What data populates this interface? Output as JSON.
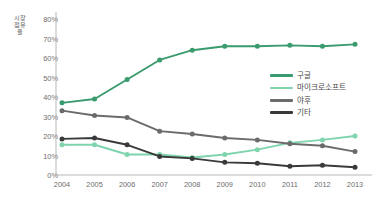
{
  "chart_data": {
    "type": "line",
    "title": "",
    "xlabel": "",
    "ylabel": "시장점유율",
    "categories": [
      "2004",
      "2005",
      "2006",
      "2007",
      "2008",
      "2009",
      "2010",
      "2011",
      "2012",
      "2013"
    ],
    "ylim": [
      0,
      80
    ],
    "ytick_values": [
      0,
      10,
      20,
      30,
      40,
      50,
      60,
      70,
      80
    ],
    "ytick_labels": [
      "0%",
      "10%",
      "20%",
      "30%",
      "40%",
      "50%",
      "60%",
      "70%",
      "80%"
    ],
    "grid": false,
    "legend_position": "right",
    "value_unit": "%",
    "series": [
      {
        "name": "구글",
        "color": "#3a9b6e",
        "values": [
          37,
          39,
          49,
          59,
          64,
          66,
          66,
          66.5,
          66,
          67
        ]
      },
      {
        "name": "마이크로소프트",
        "color": "#7fd4ae",
        "values": [
          15.5,
          15.5,
          10.5,
          10.5,
          9,
          10.5,
          13,
          16.5,
          18,
          20
        ]
      },
      {
        "name": "야후",
        "color": "#6b6b6b",
        "values": [
          33,
          30.5,
          29.5,
          22.5,
          21,
          19,
          18,
          16,
          15,
          12
        ]
      },
      {
        "name": "기타",
        "color": "#3a3a3a",
        "values": [
          18.5,
          19,
          15.5,
          9.5,
          8.5,
          6.5,
          6,
          4.5,
          5,
          4
        ]
      }
    ]
  },
  "axis": {
    "y_title": "시장점유율"
  }
}
